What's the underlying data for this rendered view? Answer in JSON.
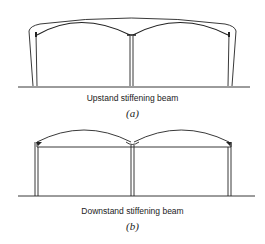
{
  "figures": [
    {
      "id": "a",
      "caption": "Upstand stiffening beam",
      "label": "(a)"
    },
    {
      "id": "b",
      "caption": "Downstand stiffening beam",
      "label": "(b)"
    }
  ],
  "colors": {
    "line": "#222222",
    "background": "#ffffff"
  }
}
